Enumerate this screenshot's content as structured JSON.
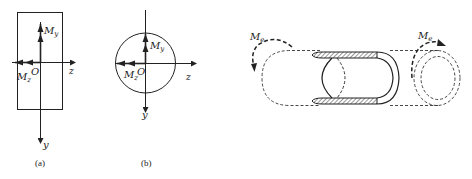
{
  "figure_a": {
    "caption": "(a)",
    "shape": "rectangle",
    "labels": {
      "my": "M",
      "my_sub": "y",
      "mz": "M",
      "mz_sub": "z",
      "origin": "O",
      "z_axis": "z",
      "y_axis": "y"
    }
  },
  "figure_b": {
    "caption": "(b)",
    "shape": "circle",
    "labels": {
      "my": "M",
      "my_sub": "y",
      "mz": "M",
      "mz_sub": "z",
      "origin": "O",
      "z_axis": "z",
      "y_axis": "y"
    }
  },
  "figure_c": {
    "shape": "thin-walled tube cutaway",
    "labels": {
      "left_moment": "M",
      "left_moment_sub": "e",
      "right_moment": "M",
      "right_moment_sub": "e"
    }
  },
  "colors": {
    "stroke": "#222222",
    "background": "#ffffff"
  }
}
